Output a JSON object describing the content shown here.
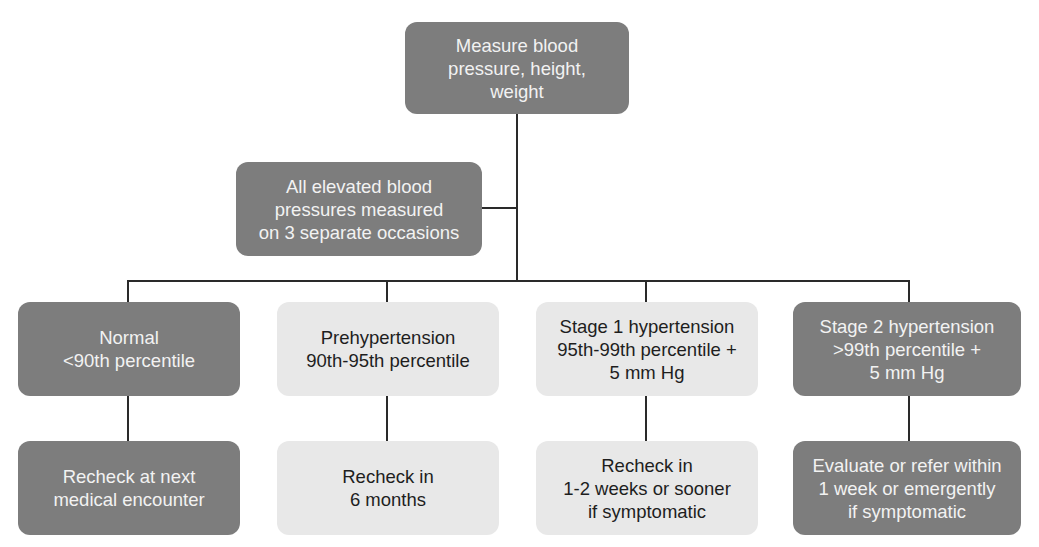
{
  "diagram": {
    "root": {
      "text": "Measure blood\npressure, height,\nweight"
    },
    "confirm": {
      "text": "All elevated blood\npressures measured\non 3 separate occasions"
    },
    "categories": [
      {
        "text": "Normal\n<90th percentile",
        "action": "Recheck at next\nmedical encounter",
        "shade": "dark"
      },
      {
        "text": "Prehypertension\n90th-95th percentile",
        "action": "Recheck in\n6 months",
        "shade": "light"
      },
      {
        "text": "Stage 1 hypertension\n95th-99th percentile +\n5 mm Hg",
        "action": "Recheck in\n1-2 weeks or sooner\nif symptomatic",
        "shade": "light"
      },
      {
        "text": "Stage 2 hypertension\n>99th percentile +\n5 mm Hg",
        "action": "Evaluate or refer within\n1 week or emergently\nif symptomatic",
        "shade": "dark"
      }
    ],
    "colors": {
      "dark": "#7d7d7d",
      "light": "#e8e8e8",
      "line": "#2a2a2a"
    }
  }
}
